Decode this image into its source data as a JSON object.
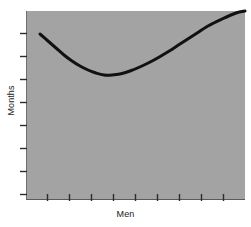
{
  "chart_data": {
    "type": "line",
    "title": "",
    "subtitle": "",
    "xlabel": "Men",
    "ylabel": "Months",
    "grid": false,
    "legend": null,
    "annotations": [],
    "axis": {
      "x": {
        "label": "Men",
        "tick_labels": [],
        "tick_count": 10,
        "range_note": "unlabeled ticks, evenly spaced"
      },
      "y": {
        "label": "Months",
        "tick_labels": [],
        "tick_count": 8,
        "range_note": "unlabeled ticks, evenly spaced"
      }
    },
    "series": [
      {
        "name": "schedule-vs-staff",
        "shape": "u-curve",
        "stroke_color": "#111111",
        "stroke_width": 3,
        "points": [
          {
            "x": 40,
            "y": 34
          },
          {
            "x": 48,
            "y": 41
          },
          {
            "x": 56,
            "y": 48
          },
          {
            "x": 64,
            "y": 55
          },
          {
            "x": 72,
            "y": 61
          },
          {
            "x": 80,
            "y": 66
          },
          {
            "x": 88,
            "y": 70
          },
          {
            "x": 96,
            "y": 73
          },
          {
            "x": 104,
            "y": 75
          },
          {
            "x": 112,
            "y": 75
          },
          {
            "x": 120,
            "y": 74
          },
          {
            "x": 130,
            "y": 71
          },
          {
            "x": 142,
            "y": 66
          },
          {
            "x": 154,
            "y": 60
          },
          {
            "x": 166,
            "y": 53
          },
          {
            "x": 180,
            "y": 44
          },
          {
            "x": 194,
            "y": 35
          },
          {
            "x": 208,
            "y": 26
          },
          {
            "x": 222,
            "y": 19
          },
          {
            "x": 236,
            "y": 13
          },
          {
            "x": 245,
            "y": 11
          }
        ],
        "minimum_point": {
          "x": 108,
          "y": 75
        }
      }
    ],
    "colors": {
      "plot_background": "#a3a3a3",
      "curve": "#111111",
      "tick": "#2b2b2b",
      "text": "#1a1a1a",
      "page_background": "#ffffff"
    },
    "plot_area": {
      "left": 26,
      "top": 11,
      "right": 245,
      "bottom": 200
    }
  }
}
